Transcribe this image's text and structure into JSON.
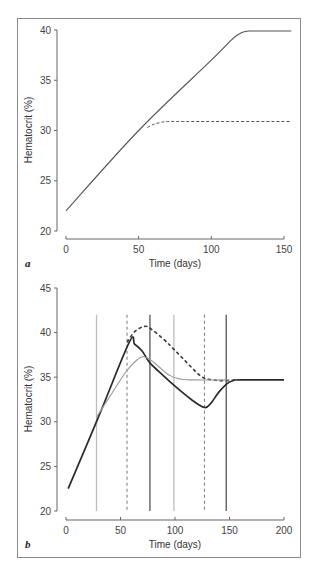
{
  "figure": {
    "border_color": "#8a8a8a"
  },
  "chart_data": [
    {
      "panel": "a",
      "type": "line",
      "xlabel": "Time (days)",
      "ylabel": "Hematocrit (%)",
      "xlim": [
        0,
        150
      ],
      "ylim": [
        20,
        40
      ],
      "xticks": [
        0,
        50,
        100,
        150
      ],
      "yticks": [
        20,
        25,
        30,
        35,
        40
      ],
      "grid": false,
      "legend": null,
      "series": [
        {
          "name": "solid",
          "style": "solid",
          "color": "#555555",
          "x": [
            0,
            50,
            100,
            113,
            118,
            122,
            126,
            130,
            155
          ],
          "y": [
            22,
            30,
            37,
            38.9,
            39.5,
            39.8,
            39.9,
            39.9,
            39.9
          ]
        },
        {
          "name": "dashed",
          "style": "dashed",
          "color": "#555555",
          "x": [
            56,
            60,
            65,
            70,
            80,
            100,
            155
          ],
          "y": [
            30.3,
            30.6,
            30.8,
            30.9,
            30.9,
            30.9,
            30.9
          ]
        }
      ]
    },
    {
      "panel": "b",
      "type": "line",
      "xlabel": "Time (days)",
      "ylabel": "Hematocrit (%)",
      "xlim": [
        0,
        200
      ],
      "ylim": [
        20,
        45
      ],
      "xticks": [
        0,
        50,
        100,
        150,
        200
      ],
      "yticks": [
        20,
        25,
        30,
        35,
        40,
        45
      ],
      "grid": false,
      "legend": null,
      "vertical_lines": [
        {
          "x": 28,
          "style": "solid",
          "color": "#bdbdbd"
        },
        {
          "x": 56,
          "style": "dashed",
          "color": "#777777"
        },
        {
          "x": 77,
          "style": "solid",
          "color": "#555555"
        },
        {
          "x": 99,
          "style": "solid",
          "color": "#bdbdbd"
        },
        {
          "x": 127,
          "style": "dashed",
          "color": "#777777"
        },
        {
          "x": 147,
          "style": "solid",
          "color": "#555555"
        }
      ],
      "vertical_line_top": 42,
      "series": [
        {
          "name": "black-solid",
          "style": "solid",
          "color": "#2a2a2a",
          "x": [
            2,
            30,
            58,
            63,
            70,
            77,
            90,
            100,
            115,
            127,
            133,
            140,
            147,
            153,
            160,
            200
          ],
          "y": [
            22.5,
            30.6,
            38.9,
            38.7,
            37.9,
            36.6,
            35.1,
            34,
            32.5,
            31.6,
            32.1,
            33.3,
            34.2,
            34.6,
            34.7,
            34.7
          ]
        },
        {
          "name": "dashed",
          "style": "dashed",
          "color": "#3a3a3a",
          "x": [
            56,
            63,
            72,
            78,
            90,
            100,
            112,
            125,
            135,
            145,
            155
          ],
          "y": [
            38.9,
            40.1,
            40.7,
            40.4,
            39.2,
            38,
            36.5,
            35,
            34.7,
            34.6,
            34.7
          ]
        },
        {
          "name": "gray-dotted",
          "style": "dotted-gray",
          "color": "#9a9a9a",
          "x": [
            28,
            40,
            55,
            63,
            70,
            77,
            85,
            95,
            105,
            115,
            150
          ],
          "y": [
            30.5,
            32.8,
            35.6,
            36.7,
            37.3,
            37.0,
            36.2,
            35.2,
            34.8,
            34.7,
            34.7
          ]
        }
      ]
    }
  ]
}
